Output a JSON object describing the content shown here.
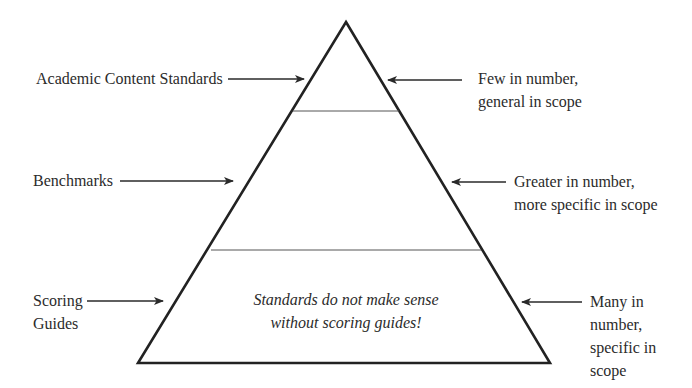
{
  "diagram": {
    "type": "pyramid",
    "colors": {
      "stroke": "#222222",
      "divider": "#555555",
      "text": "#2b2b2b",
      "background": "#ffffff"
    },
    "levels": [
      {
        "name": "Academic Content Standards",
        "left_label": [
          "Academic Content Standards"
        ],
        "right_label": [
          "Few in number,",
          "general in scope"
        ]
      },
      {
        "name": "Benchmarks",
        "left_label": [
          "Benchmarks"
        ],
        "right_label": [
          "Greater in number,",
          "more specific in scope"
        ]
      },
      {
        "name": "Scoring Guides",
        "left_label": [
          "Scoring",
          "Guides"
        ],
        "right_label": [
          "Many in",
          "number,",
          "specific in",
          "scope"
        ],
        "inner_note": [
          "Standards do not make sense",
          "without scoring guides!"
        ]
      }
    ]
  }
}
